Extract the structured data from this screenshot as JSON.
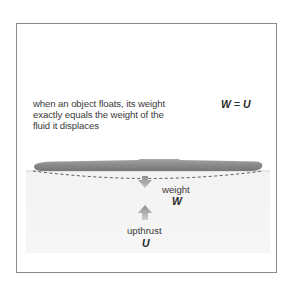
{
  "caption": {
    "line1": "when an object floats, its weight",
    "line2": "exactly equals the weight of the",
    "line3": "fluid it displaces"
  },
  "equation": {
    "left": "W",
    "operator": "=",
    "right": "U"
  },
  "forces": {
    "weight": {
      "label": "weight",
      "symbol": "W",
      "direction": "down"
    },
    "upthrust": {
      "label": "upthrust",
      "symbol": "U",
      "direction": "up"
    }
  },
  "colors": {
    "object": "#8c8c8c",
    "arrow": "#9a9a9a",
    "water": "#f4f4f4",
    "border": "#8a8a8a",
    "text": "#3a3a3a"
  },
  "icons": {
    "floating_object": "elongated-floating-body",
    "down_arrow": "arrow-down-icon",
    "up_arrow": "arrow-up-icon"
  }
}
